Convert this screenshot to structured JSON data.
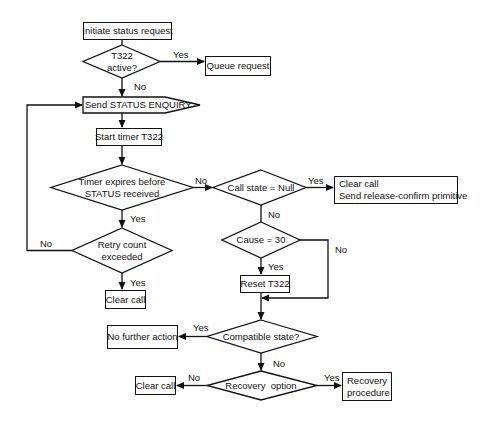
{
  "diagram": {
    "type": "flowchart",
    "colors": {
      "stroke": "#111111",
      "background": "#ffffff",
      "text": "#111111"
    },
    "nodes": {
      "initiate": {
        "shape": "process",
        "label": "Initiate status request"
      },
      "t322_active": {
        "shape": "decision",
        "line1": "T322",
        "line2": "active?"
      },
      "queue_request": {
        "shape": "process",
        "label": "Queue request"
      },
      "send_enquiry": {
        "shape": "send-signal",
        "label": "Send STATUS ENQUIRY"
      },
      "start_timer": {
        "shape": "process",
        "label": "Start timer T322"
      },
      "timer_expires": {
        "shape": "decision",
        "line1": "Timer expires before",
        "line2": "STATUS received"
      },
      "retry_count": {
        "shape": "decision",
        "line1": "Retry count",
        "line2": "exceeded"
      },
      "clear_call_1": {
        "shape": "process",
        "label": "Clear call"
      },
      "call_state_null": {
        "shape": "decision",
        "label": "Call state = Null"
      },
      "clear_and_release": {
        "shape": "process",
        "line1": "Clear call",
        "line2": "Send release-confirm primitive"
      },
      "cause_30": {
        "shape": "decision",
        "label": "Cause = 30"
      },
      "reset_t322": {
        "shape": "process",
        "label": "Reset T322"
      },
      "compatible_state": {
        "shape": "decision",
        "label": "Compatible state?"
      },
      "no_further_action": {
        "shape": "process",
        "label": "No further action"
      },
      "recovery_option": {
        "shape": "decision",
        "label": "Recovery  option"
      },
      "clear_call_2": {
        "shape": "process",
        "label": "Clear call"
      },
      "recovery_procedure": {
        "shape": "process",
        "line1": "Recovery",
        "line2": "procedure"
      }
    },
    "edge_labels": {
      "t322_yes": "Yes",
      "t322_no": "No",
      "timer_no": "No",
      "timer_yes": "Yes",
      "retry_no": "No",
      "retry_yes": "Yes",
      "callstate_yes": "Yes",
      "callstate_no": "No",
      "cause_no": "No",
      "cause_yes": "Yes",
      "compatible_yes": "Yes",
      "compatible_no": "No",
      "recovery_no": "No",
      "recovery_yes": "Yes"
    }
  }
}
